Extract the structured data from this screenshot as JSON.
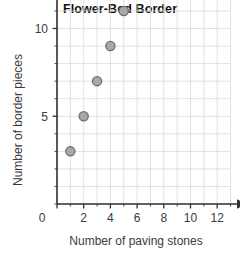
{
  "chart_data": {
    "type": "scatter",
    "title": "Flower-Bed Border",
    "xlabel": "Number of paving stones",
    "ylabel": "Number of border pieces",
    "x": [
      1,
      2,
      3,
      4,
      5
    ],
    "values": [
      3,
      5,
      7,
      9,
      11
    ],
    "points": [
      {
        "x": 1,
        "y": 3
      },
      {
        "x": 2,
        "y": 5
      },
      {
        "x": 3,
        "y": 7
      },
      {
        "x": 4,
        "y": 9
      },
      {
        "x": 5,
        "y": 11
      }
    ],
    "xlim": [
      0,
      13
    ],
    "ylim": [
      0,
      26
    ],
    "x_tick_labels": [
      "0",
      "2",
      "4",
      "6",
      "8",
      "10",
      "12"
    ],
    "x_tick_values": [
      0,
      2,
      4,
      6,
      8,
      10,
      12
    ],
    "x_minor_step": 1,
    "y_tick_labels": [
      "5",
      "10",
      "15",
      "20",
      "25"
    ],
    "y_tick_values": [
      5,
      10,
      15,
      20,
      25
    ],
    "y_minor_step": 1,
    "y_origin_label": "0",
    "grid": true,
    "legend": false,
    "colors": {
      "marker_fill": "#a8a8a8",
      "marker_stroke": "#6e6e6e",
      "grid_line": "#d9d9d9",
      "axis_line": "#333333",
      "title_text": "#111111",
      "label_text": "#3b3b3b",
      "background": "#ffffff"
    }
  }
}
